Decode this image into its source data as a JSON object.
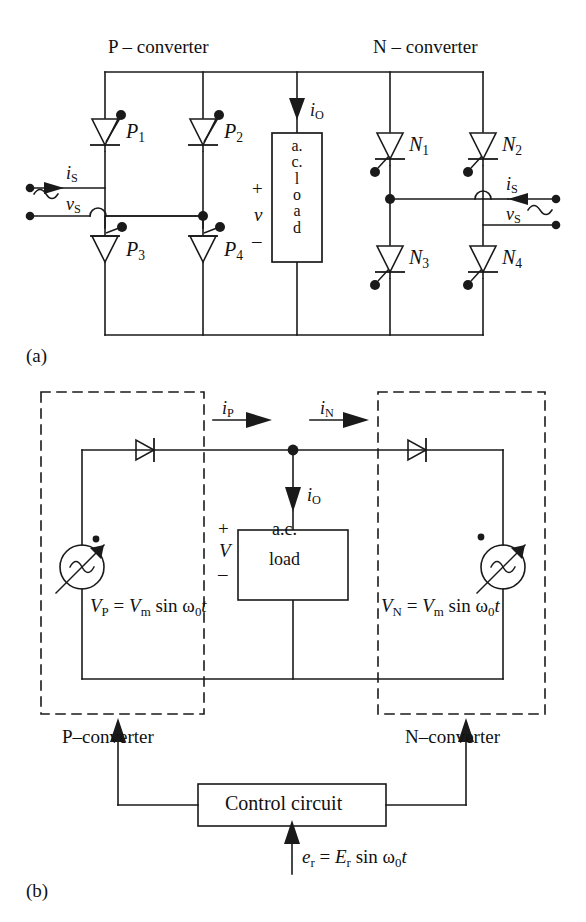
{
  "figure": {
    "kind": "circuit-diagram",
    "panel_labels": {
      "a": "(a)",
      "b": "(b)"
    },
    "colors": {
      "line": "#1a1a1a",
      "background": "#ffffff",
      "text": "#111111"
    }
  },
  "panel_a": {
    "caption": "(a)",
    "headings": {
      "p_converter": "P – converter",
      "n_converter": "N – converter"
    },
    "thyristors": [
      {
        "id": "P1",
        "label": "P",
        "sub": "1",
        "orientation": "down",
        "gate": "top-right"
      },
      {
        "id": "P2",
        "label": "P",
        "sub": "2",
        "orientation": "down",
        "gate": "top-right"
      },
      {
        "id": "P3",
        "label": "P",
        "sub": "3",
        "orientation": "down",
        "gate": "top-right"
      },
      {
        "id": "P4",
        "label": "P",
        "sub": "4",
        "orientation": "down",
        "gate": "top-right"
      },
      {
        "id": "N1",
        "label": "N",
        "sub": "1",
        "orientation": "down",
        "gate": "bottom-left"
      },
      {
        "id": "N2",
        "label": "N",
        "sub": "2",
        "orientation": "down",
        "gate": "bottom-left"
      },
      {
        "id": "N3",
        "label": "N",
        "sub": "3",
        "orientation": "down",
        "gate": "bottom-left"
      },
      {
        "id": "N4",
        "label": "N",
        "sub": "4",
        "orientation": "down",
        "gate": "bottom-left"
      }
    ],
    "load": {
      "text_vertical": [
        "a.",
        "c.",
        "l",
        "o",
        "a",
        "d"
      ],
      "plus": "+",
      "minus": "–",
      "voltage": "v",
      "current": "i",
      "current_sub": "O"
    },
    "sources": [
      {
        "side": "left",
        "current": "i",
        "current_sub": "S",
        "voltage": "v",
        "voltage_sub": "S",
        "arrow": "right"
      },
      {
        "side": "right",
        "current": "i",
        "current_sub": "S",
        "voltage": "v",
        "voltage_sub": "S",
        "arrow": "left"
      }
    ]
  },
  "panel_b": {
    "caption": "(b)",
    "boxes": {
      "p_converter": "P–converter",
      "n_converter": "N–converter",
      "control_circuit": "Control circuit"
    },
    "load": {
      "line1": "a.c.",
      "line2": "load",
      "plus": "+",
      "minus": "–",
      "voltage": "V"
    },
    "currents": [
      {
        "id": "iP",
        "label": "i",
        "sub": "P",
        "direction": "right"
      },
      {
        "id": "iN",
        "label": "i",
        "sub": "N",
        "direction": "right"
      },
      {
        "id": "iO",
        "label": "i",
        "sub": "O",
        "direction": "down"
      }
    ],
    "source_equations": {
      "p": "Vₚ = Vₘ sin ω₀t",
      "n": "Vₙ = Vₘ sin ω₀t",
      "p_parts": {
        "lhs": "V",
        "lhs_sub": "P",
        "eq": "=",
        "amp": "V",
        "amp_sub": "m",
        "fn": "sin",
        "omega": "ω",
        "omega_sub": "0",
        "t": "t"
      },
      "n_parts": {
        "lhs": "V",
        "lhs_sub": "N",
        "eq": "=",
        "amp": "V",
        "amp_sub": "m",
        "fn": "sin",
        "omega": "ω",
        "omega_sub": "0",
        "t": "t"
      }
    },
    "reference_signal": {
      "full": "eᵣ = Eᵣ sin ω₀t",
      "parts": {
        "lhs": "e",
        "lhs_sub": "r",
        "eq": "=",
        "amp": "E",
        "amp_sub": "r",
        "fn": "sin",
        "omega": "ω",
        "omega_sub": "0",
        "t": "t"
      }
    },
    "symbols": {
      "source": "variable-ac-source",
      "diode_left": "diode-right-pointing",
      "diode_right": "diode-right-pointing"
    }
  }
}
